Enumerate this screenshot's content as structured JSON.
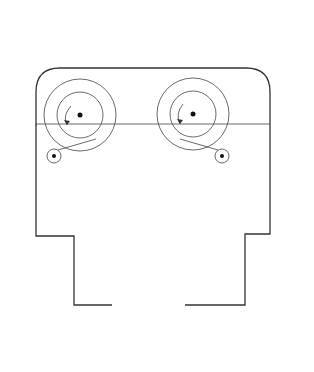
{
  "diagram": {
    "type": "aerial-camera-cross-section",
    "labels": {
      "exposed_reel_1": "Exposed",
      "exposed_reel_2": "film reel",
      "unexposed_reel_1": "Unexposed",
      "unexposed_reel_2": "film reel",
      "focal_plane_1": "Focal",
      "focal_plane_2": "plane",
      "optical_axis_1": "Optical",
      "optical_axis_2": "axis",
      "cone": "Cone",
      "shutter": "Shutter",
      "diaphragm": "Diaphragm",
      "filter": "Filter",
      "lens_elements_1": "Lens",
      "lens_elements_2": "elements"
    },
    "dimensions": {
      "magazine": "Magazine",
      "body": "Body",
      "lens_cone_1": "Lens cone",
      "lens_cone_2": "assembly"
    },
    "colors": {
      "outline": "#333333",
      "lens_fill": "#8c8c8c",
      "filter_fill": "#b8b8b8",
      "text": "#222222"
    }
  }
}
